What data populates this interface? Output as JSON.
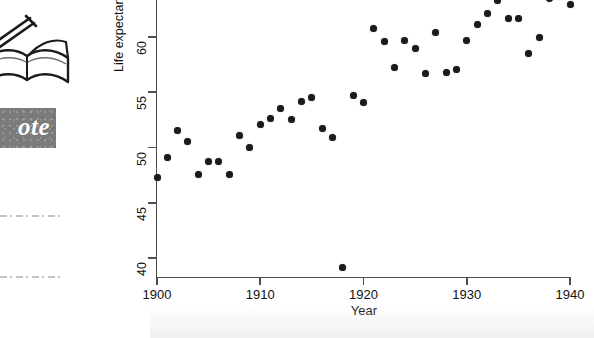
{
  "page": {
    "background_color": "#ffffff",
    "ink_color": "#1b1b1b"
  },
  "margin_note": {
    "icon_name": "pen-writing-on-book-icon",
    "badge_label": "ote",
    "badge_full_word": "Note",
    "badge_color": "#7b7b7b",
    "badge_text_color": "#ffffff"
  },
  "chart_data": {
    "type": "scatter",
    "title": "",
    "xlabel": "Year",
    "ylabel": "Life expectancy",
    "xlim": [
      1899,
      1940.6
    ],
    "ylim": [
      38.6,
      63.4
    ],
    "xticks": [
      1900,
      1910,
      1920,
      1930,
      1940
    ],
    "xtick_labels": [
      "1900",
      "1910",
      "1920",
      "1930",
      "1940"
    ],
    "yticks": [
      40,
      45,
      50,
      55,
      60
    ],
    "ytick_labels": [
      "40",
      "45",
      "50",
      "55",
      "60"
    ],
    "grid": false,
    "legend": null,
    "marker": "filled-circle",
    "marker_color": "#1b1b1b",
    "annotations": [],
    "x": [
      1900,
      1901,
      1902,
      1903,
      1904,
      1905,
      1906,
      1907,
      1908,
      1909,
      1910,
      1911,
      1912,
      1913,
      1914,
      1915,
      1916,
      1917,
      1918,
      1919,
      1920,
      1921,
      1922,
      1923,
      1924,
      1925,
      1926,
      1927,
      1928,
      1929,
      1930,
      1931,
      1932,
      1933,
      1934,
      1935,
      1936,
      1937,
      1938,
      1939,
      1940
    ],
    "values": [
      47.3,
      49.1,
      51.5,
      50.5,
      47.6,
      48.7,
      48.7,
      47.6,
      51.1,
      50.0,
      52.1,
      52.6,
      53.5,
      52.5,
      54.2,
      54.5,
      51.7,
      50.9,
      39.1,
      54.7,
      54.1,
      60.8,
      59.6,
      57.2,
      59.7,
      59.0,
      56.7,
      60.4,
      56.8,
      57.1,
      59.7,
      61.1,
      62.1,
      63.3,
      61.7,
      61.7,
      58.5,
      60.0,
      63.5,
      63.7,
      62.9
    ],
    "series_name": "US life expectancy at birth"
  }
}
